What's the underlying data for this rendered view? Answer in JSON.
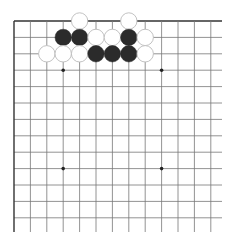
{
  "board": {
    "type": "go-board-corner",
    "origin": {
      "x": 14,
      "y": 21
    },
    "spacing": 16.4,
    "cols": 13,
    "rows": 13,
    "line_color": "#777777",
    "edge_color": "#333333",
    "stone_radius": 8.2,
    "colors": {
      "black": "#2b2b2b",
      "white": "#ffffff",
      "white_outline": "#bbbbbb"
    },
    "star_points": [
      {
        "col": 3,
        "row": 3
      },
      {
        "col": 9,
        "row": 3
      },
      {
        "col": 3,
        "row": 9
      },
      {
        "col": 9,
        "row": 9
      }
    ],
    "stones": [
      {
        "color": "white",
        "col": 4,
        "row": 0
      },
      {
        "color": "white",
        "col": 7,
        "row": 0
      },
      {
        "color": "black",
        "col": 3,
        "row": 1
      },
      {
        "color": "black",
        "col": 4,
        "row": 1
      },
      {
        "color": "white",
        "col": 5,
        "row": 1
      },
      {
        "color": "white",
        "col": 6,
        "row": 1
      },
      {
        "color": "black",
        "col": 7,
        "row": 1
      },
      {
        "color": "white",
        "col": 8,
        "row": 1
      },
      {
        "color": "white",
        "col": 2,
        "row": 2
      },
      {
        "color": "white",
        "col": 3,
        "row": 2
      },
      {
        "color": "white",
        "col": 4,
        "row": 2
      },
      {
        "color": "black",
        "col": 5,
        "row": 2
      },
      {
        "color": "black",
        "col": 6,
        "row": 2
      },
      {
        "color": "black",
        "col": 7,
        "row": 2
      },
      {
        "color": "white",
        "col": 8,
        "row": 2
      }
    ]
  }
}
